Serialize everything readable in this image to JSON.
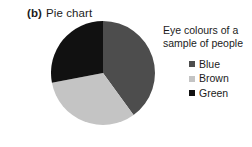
{
  "figure": {
    "label": "(b)",
    "title": "Pie chart"
  },
  "legend": {
    "title": "Eye colours of a sample of people",
    "title_line_1": "Eye colours of a",
    "title_line_2": "sample of people",
    "items": [
      {
        "label": "Blue",
        "color": "#4d4d4d"
      },
      {
        "label": "Brown",
        "color": "#c4c4c4"
      },
      {
        "label": "Green",
        "color": "#111111"
      }
    ]
  },
  "chart_data": {
    "type": "pie",
    "title": "Eye colours of a sample of people",
    "categories": [
      "Blue",
      "Brown",
      "Green"
    ],
    "values": [
      40,
      32,
      28
    ],
    "unit": "percent",
    "colors": [
      "#4d4d4d",
      "#c4c4c4",
      "#111111"
    ],
    "start_angle_deg": 0,
    "direction": "clockwise",
    "legend_position": "right",
    "grid": false,
    "data_labels": false
  }
}
